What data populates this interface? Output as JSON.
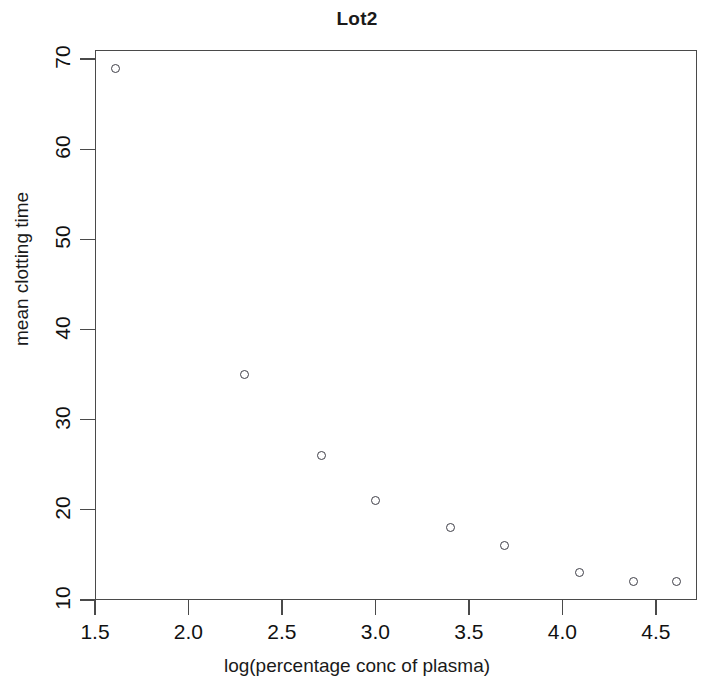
{
  "chart_data": {
    "type": "scatter",
    "title": "Lot2",
    "xlabel": "log(percentage conc of plasma)",
    "ylabel": "mean clotting time",
    "xlim": [
      1.5,
      4.72
    ],
    "ylim": [
      10,
      71
    ],
    "xticks": [
      "1.5",
      "2.0",
      "2.5",
      "3.0",
      "3.5",
      "4.0",
      "4.5"
    ],
    "xtick_values": [
      1.5,
      2.0,
      2.5,
      3.0,
      3.5,
      4.0,
      4.5
    ],
    "yticks": [
      "10",
      "20",
      "30",
      "40",
      "50",
      "60",
      "70"
    ],
    "ytick_values": [
      10,
      20,
      30,
      40,
      50,
      60,
      70
    ],
    "grid": false,
    "legend": "none",
    "marker": "open-circle",
    "marker_color": "#3f3f48",
    "x": [
      1.61,
      2.3,
      2.71,
      3.0,
      3.4,
      3.69,
      4.09,
      4.38,
      4.61
    ],
    "y": [
      69,
      35,
      26,
      21,
      18,
      16,
      13,
      12,
      12
    ],
    "points": [
      {
        "x": 1.61,
        "y": 69
      },
      {
        "x": 2.3,
        "y": 35
      },
      {
        "x": 2.71,
        "y": 26
      },
      {
        "x": 3.0,
        "y": 21
      },
      {
        "x": 3.4,
        "y": 18
      },
      {
        "x": 3.69,
        "y": 16
      },
      {
        "x": 4.09,
        "y": 13
      },
      {
        "x": 4.38,
        "y": 12
      },
      {
        "x": 4.61,
        "y": 12
      }
    ]
  }
}
